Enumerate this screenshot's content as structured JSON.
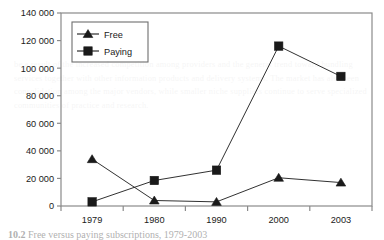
{
  "chart_data": {
    "type": "line",
    "title": "",
    "subtitle": "",
    "xlabel": "",
    "ylabel": "",
    "categories": [
      "1979",
      "1980",
      "1990",
      "2000",
      "2003"
    ],
    "series": [
      {
        "name": "Free",
        "marker": "triangle",
        "color": "#1a1a1a",
        "values": [
          34000,
          4000,
          3000,
          20500,
          17000
        ]
      },
      {
        "name": "Paying",
        "marker": "square",
        "color": "#1a1a1a",
        "values": [
          3000,
          18500,
          26000,
          116000,
          94000
        ]
      }
    ],
    "ylim": [
      0,
      140000
    ],
    "yticks": [
      0,
      20000,
      40000,
      60000,
      80000,
      100000,
      120000,
      140000
    ],
    "ytick_labels": [
      "0",
      "20 000",
      "40 000",
      "60 000",
      "80 000",
      "100 000",
      "120 000",
      "140 000"
    ],
    "grid": false,
    "legend_position": "top-left",
    "legend_entries": [
      "Free",
      "Paying"
    ],
    "axis_color": "#8a8a8a",
    "plot_border": true,
    "background": "#ffffff"
  },
  "caption": {
    "number": "10.2",
    "text": "Free versus paying subscriptions, 1979-2003"
  },
  "bleed_text": "be a result of the increased competition among providers and the general trend toward bundling services together with other information products and delivery systems. The market has also seen consolidation among the major vendors, while smaller niche suppliers continue to serve specialized communities of practice and research."
}
